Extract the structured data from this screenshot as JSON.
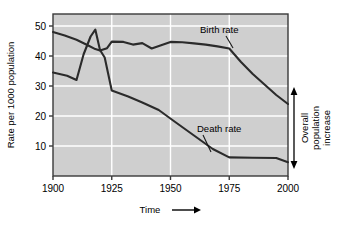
{
  "chart_data": {
    "type": "line",
    "title": "",
    "xlabel": "Time",
    "ylabel": "Rate per 1000 population",
    "xlim": [
      1900,
      2000
    ],
    "ylim": [
      0,
      54
    ],
    "grid": true,
    "grid_style": "white horizontal and vertical lines on gray plot background",
    "legend": "inline annotations",
    "xticks": [
      1900,
      1925,
      1950,
      1975,
      2000
    ],
    "xtick_labels": [
      "1900",
      "1925",
      "1950",
      "1975",
      "2000"
    ],
    "yticks": [
      10,
      20,
      30,
      40,
      50
    ],
    "ytick_labels": [
      "10",
      "20",
      "30",
      "40",
      "50"
    ],
    "series": [
      {
        "name": "Birth rate",
        "color": "#2b2b2b",
        "x": [
          1900,
          1905,
          1910,
          1915,
          1918,
          1920,
          1923,
          1925,
          1930,
          1934,
          1938,
          1942,
          1946,
          1950,
          1955,
          1960,
          1965,
          1970,
          1975,
          1980,
          1985,
          1990,
          1995,
          2000
        ],
        "values": [
          48.0,
          46.8,
          45.4,
          43.5,
          42.3,
          41.8,
          42.6,
          44.8,
          44.7,
          43.8,
          44.3,
          42.5,
          43.6,
          44.7,
          44.6,
          44.2,
          43.8,
          43.2,
          42.5,
          38.0,
          34.0,
          30.5,
          27.0,
          24.0
        ]
      },
      {
        "name": "Death rate",
        "color": "#2b2b2b",
        "x": [
          1900,
          1906,
          1910,
          1913,
          1916,
          1918,
          1920,
          1922,
          1925,
          1932,
          1938,
          1945,
          1952,
          1960,
          1968,
          1975,
          1985,
          1995,
          2000
        ],
        "values": [
          34.5,
          33.4,
          32.0,
          40.5,
          46.5,
          48.8,
          42.0,
          39.5,
          28.5,
          26.5,
          24.5,
          22.0,
          18.0,
          13.5,
          9.0,
          6.2,
          6.1,
          6.0,
          4.6
        ]
      }
    ],
    "annotations": [
      {
        "name": "birth-rate-label",
        "text": "Birth rate",
        "x_px": 200,
        "y_px": 30,
        "leader_to": {
          "x_px": 232,
          "y_px": 47
        }
      },
      {
        "name": "death-rate-label",
        "text": "Death rate",
        "x_px": 197,
        "y_px": 129,
        "leader_to": {
          "x_px": 208,
          "y_px": 152
        }
      },
      {
        "name": "overall-increase-bracket",
        "lines": [
          "Overall",
          "population",
          "increase"
        ],
        "arrow": "double-headed vertical arrow at year 2000 spanning from death rate to birth rate"
      }
    ]
  },
  "axes": {
    "y_title": "Rate per 1000 population",
    "x_title": "Time",
    "x_title_arrow": "⟶"
  },
  "colors": {
    "plot_background": "#cfcfcf",
    "page_background": "#ffffff",
    "grid_line": "#ffffff",
    "axis_line": "#3a3a3a",
    "series_line": "#2b2b2b",
    "text": "#000000"
  },
  "figure": {
    "width": 340,
    "height": 225
  }
}
